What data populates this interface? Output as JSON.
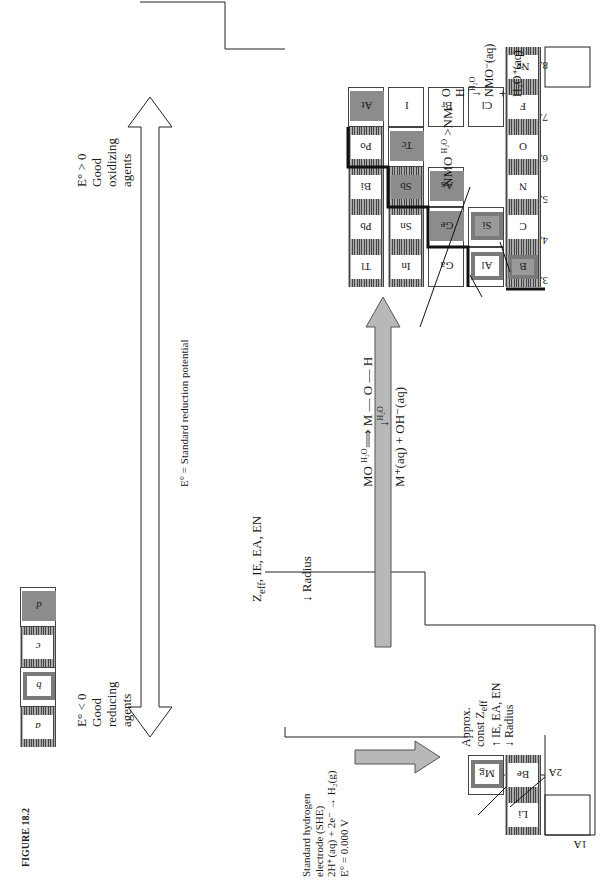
{
  "figure": {
    "caption": "FIGURE 18.2",
    "group_labels": [
      "1A",
      "2A",
      "3A",
      "4A",
      "5A",
      "6A",
      "7A",
      "8A"
    ],
    "elements": {
      "Li": {
        "symbol": "Li",
        "group": "1A",
        "style": "a"
      },
      "Be": {
        "symbol": "Be",
        "group": "2A",
        "style": "a"
      },
      "Mg": {
        "symbol": "Mg",
        "group": "2A",
        "style": "b"
      },
      "B": {
        "symbol": "B",
        "group": "3A",
        "style": "b"
      },
      "Al": {
        "symbol": "Al",
        "group": "3A",
        "style": "b"
      },
      "Ga": {
        "symbol": "Ga",
        "group": "3A",
        "style": "plain"
      },
      "In": {
        "symbol": "In",
        "group": "3A",
        "style": "c"
      },
      "Tl": {
        "symbol": "Tl",
        "group": "3A",
        "style": "c"
      },
      "C": {
        "symbol": "C",
        "group": "4A",
        "style": "c"
      },
      "Si": {
        "symbol": "Si",
        "group": "4A",
        "style": "b"
      },
      "Ge": {
        "symbol": "Ge",
        "group": "4A",
        "style": "d"
      },
      "Sn": {
        "symbol": "Sn",
        "group": "4A",
        "style": "c"
      },
      "Pb": {
        "symbol": "Pb",
        "group": "4A",
        "style": "c"
      },
      "N": {
        "symbol": "N",
        "group": "5A",
        "style": "c"
      },
      "As": {
        "symbol": "As",
        "group": "5A",
        "style": "d"
      },
      "Sb": {
        "symbol": "Sb",
        "group": "5A",
        "style": "d"
      },
      "Bi": {
        "symbol": "Bi",
        "group": "5A",
        "style": "c"
      },
      "O": {
        "symbol": "O",
        "group": "6A",
        "style": "c"
      },
      "Tc": {
        "symbol": "Tc",
        "group": "6A",
        "style": "d"
      },
      "Po": {
        "symbol": "Po",
        "group": "6A",
        "style": "c"
      },
      "F": {
        "symbol": "F",
        "group": "7A",
        "style": "c"
      },
      "Cl": {
        "symbol": "Cl",
        "group": "7A",
        "style": "plain"
      },
      "Br": {
        "symbol": "Br",
        "group": "7A",
        "style": "plain"
      },
      "I": {
        "symbol": "I",
        "group": "7A",
        "style": "plain"
      },
      "At": {
        "symbol": "At",
        "group": "7A",
        "style": "d"
      },
      "Ne": {
        "symbol": "Ne",
        "group": "8A",
        "style": "c"
      }
    },
    "she_note": {
      "line1": "Standard hydrogen",
      "line2": "electrode (SHE)",
      "line3": "2H⁺(aq) + 2e⁻ → H₂(g)",
      "line4": "E° = 0.000 V"
    },
    "reducing_note": {
      "line1": "E° < 0",
      "line2": "Good",
      "line3": "reducing",
      "line4": "agents"
    },
    "oxidizing_note": {
      "line1": "E° > 0",
      "line2": "Good",
      "line3": "oxidizing",
      "line4": "agents"
    },
    "potential_label": "E° = Standard reduction potential",
    "period_trend": {
      "up": "↑  Z_eff, IE, EA, EN",
      "down": "↓  Radius"
    },
    "period_trend_up_main": "Z",
    "period_trend_up_sub": "eff",
    "period_trend_up_rest": ", IE, EA, EN",
    "group_trend": {
      "line1": "Approx.",
      "line2_main": "const  Z",
      "line2_sub": "eff",
      "line3": "↑  IE, EA, EN",
      "line4": "↓  Radius"
    },
    "basic_oxide": {
      "line1_left": "MO",
      "line1_arrow_label": "H₂O",
      "line1_right": "M — O — H",
      "line2_arrow": "↓",
      "line2_label": "H₂O",
      "line3": "M⁺(aq) + OH⁻(aq)"
    },
    "acidic_oxide": {
      "nmo": "NMO",
      "arrow_label": "H₂O",
      "arrow_tail": ">NM",
      "bar1": "|",
      "o": "O",
      "bar2": "|",
      "h": "H",
      "down_arrow": "↓",
      "down_label": "H₂O",
      "product1": "NMO⁻(aq)",
      "plus": "+",
      "product2": "H₃O⁺(aq)"
    },
    "legend": [
      {
        "key": "a",
        "style": "a"
      },
      {
        "key": "b",
        "style": "b"
      },
      {
        "key": "c",
        "style": "c"
      },
      {
        "key": "d",
        "style": "d"
      }
    ],
    "colors": {
      "ink": "#1a1a1a",
      "trend_arrow_fill": "#b8b8b8",
      "metalloid_fill": "#8c8c8c",
      "hatch_dark": "#444444",
      "hatch_light": "#aaaaaa"
    }
  }
}
